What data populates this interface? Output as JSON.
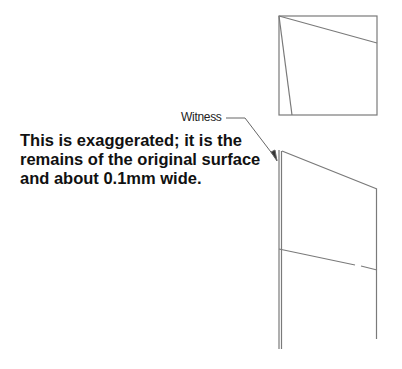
{
  "diagram": {
    "labels": {
      "witness": "Witness"
    },
    "note": {
      "lines": [
        "This is exaggerated; it is the",
        "remains of the original surface",
        "and about 0.1mm wide."
      ]
    },
    "colors": {
      "line": "#808080",
      "text": "#111111",
      "background": "#ffffff"
    }
  }
}
